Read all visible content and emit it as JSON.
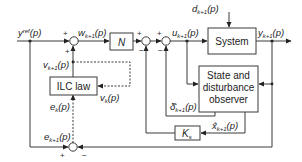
{
  "diagram": {
    "signals": {
      "reference": {
        "base": "y",
        "sup": "ref",
        "arg": "(p)"
      },
      "w": {
        "base": "w",
        "sub": "k+1",
        "arg": "(p)"
      },
      "u": {
        "base": "u",
        "sub": "k+1",
        "arg": "(p)"
      },
      "d": {
        "base": "d",
        "sub": "k+1",
        "arg": "(p)"
      },
      "y": {
        "base": "y",
        "sub": "k+1",
        "arg": "(p)"
      },
      "v_next": {
        "base": "v",
        "sub": "k+1",
        "arg": "(p)"
      },
      "v_k": {
        "base": "v",
        "sub": "k",
        "arg": "(p)"
      },
      "e_k": {
        "base": "e",
        "sub": "k",
        "arg": "(p)"
      },
      "e_next": {
        "base": "e",
        "sub": "k+1",
        "arg": "(p)"
      },
      "delta_hat": {
        "base": "δ̂",
        "sub": "k+1",
        "arg": "(p)"
      },
      "x_hat": {
        "base": "x̂",
        "sub": "k+1",
        "arg": "(p)"
      }
    },
    "blocks": {
      "N": "N",
      "system": "System",
      "observer_line1": "State and",
      "observer_line2": "disturbance",
      "observer_line3": "observer",
      "ilc": "ILC law",
      "ks_base": "K",
      "ks_sub": "s"
    },
    "signs": {
      "plus": "+",
      "minus": "−"
    }
  }
}
